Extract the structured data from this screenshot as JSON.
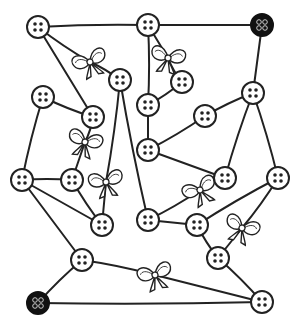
{
  "puzzle": {
    "type": "button-and-bow string network",
    "colors": {
      "line": "#222222",
      "button_fill": "#ffffff",
      "special_button_fill": "#111111"
    },
    "buttons": [
      {
        "id": "b1",
        "x": 38,
        "y": 27,
        "kind": "normal"
      },
      {
        "id": "b2",
        "x": 148,
        "y": 25,
        "kind": "normal"
      },
      {
        "id": "b3",
        "x": 262,
        "y": 25,
        "kind": "special-dark"
      },
      {
        "id": "b4",
        "x": 120,
        "y": 80,
        "kind": "normal"
      },
      {
        "id": "b5",
        "x": 182,
        "y": 82,
        "kind": "normal"
      },
      {
        "id": "b6",
        "x": 148,
        "y": 105,
        "kind": "normal"
      },
      {
        "id": "b7",
        "x": 205,
        "y": 116,
        "kind": "normal"
      },
      {
        "id": "b8",
        "x": 253,
        "y": 93,
        "kind": "normal"
      },
      {
        "id": "b9",
        "x": 43,
        "y": 97,
        "kind": "normal"
      },
      {
        "id": "b10",
        "x": 93,
        "y": 117,
        "kind": "normal"
      },
      {
        "id": "b11",
        "x": 148,
        "y": 150,
        "kind": "normal"
      },
      {
        "id": "b12",
        "x": 22,
        "y": 180,
        "kind": "normal"
      },
      {
        "id": "b13",
        "x": 72,
        "y": 180,
        "kind": "normal"
      },
      {
        "id": "b14",
        "x": 225,
        "y": 178,
        "kind": "normal"
      },
      {
        "id": "b15",
        "x": 278,
        "y": 178,
        "kind": "normal"
      },
      {
        "id": "b16",
        "x": 102,
        "y": 225,
        "kind": "normal"
      },
      {
        "id": "b17",
        "x": 148,
        "y": 220,
        "kind": "normal"
      },
      {
        "id": "b18",
        "x": 197,
        "y": 225,
        "kind": "normal"
      },
      {
        "id": "b19",
        "x": 218,
        "y": 258,
        "kind": "normal"
      },
      {
        "id": "b20",
        "x": 82,
        "y": 260,
        "kind": "normal"
      },
      {
        "id": "b21",
        "x": 38,
        "y": 303,
        "kind": "special-dark"
      },
      {
        "id": "b22",
        "x": 262,
        "y": 302,
        "kind": "normal"
      }
    ],
    "bows": [
      {
        "id": "w1",
        "x": 90,
        "y": 62
      },
      {
        "id": "w2",
        "x": 168,
        "y": 58
      },
      {
        "id": "w3",
        "x": 85,
        "y": 142
      },
      {
        "id": "w4",
        "x": 106,
        "y": 182
      },
      {
        "id": "w5",
        "x": 200,
        "y": 190
      },
      {
        "id": "w6",
        "x": 242,
        "y": 228
      },
      {
        "id": "w7",
        "x": 155,
        "y": 275
      }
    ],
    "strings": [
      [
        "b1",
        "b2"
      ],
      [
        "b2",
        "b3"
      ],
      [
        "b1",
        "w1"
      ],
      [
        "w1",
        "b4"
      ],
      [
        "b1",
        "b10"
      ],
      [
        "b9",
        "b10"
      ],
      [
        "b10",
        "w3"
      ],
      [
        "w3",
        "b13"
      ],
      [
        "b9",
        "b12"
      ],
      [
        "b12",
        "b13"
      ],
      [
        "b12",
        "b16"
      ],
      [
        "b13",
        "b16"
      ],
      [
        "b4",
        "w4"
      ],
      [
        "w4",
        "b16"
      ],
      [
        "b4",
        "b17"
      ],
      [
        "b2",
        "b6"
      ],
      [
        "b2",
        "w2"
      ],
      [
        "w2",
        "b5"
      ],
      [
        "b5",
        "b6"
      ],
      [
        "b6",
        "b11"
      ],
      [
        "b11",
        "b7"
      ],
      [
        "b7",
        "b8"
      ],
      [
        "b3",
        "b8"
      ],
      [
        "b8",
        "b14"
      ],
      [
        "b8",
        "b15"
      ],
      [
        "b11",
        "b14"
      ],
      [
        "b17",
        "w5"
      ],
      [
        "w5",
        "b14"
      ],
      [
        "b17",
        "b18"
      ],
      [
        "b15",
        "b18"
      ],
      [
        "b15",
        "w6"
      ],
      [
        "w6",
        "b19"
      ],
      [
        "b18",
        "b19"
      ],
      [
        "b19",
        "b22"
      ],
      [
        "b12",
        "b20"
      ],
      [
        "b20",
        "b21"
      ],
      [
        "b20",
        "w7"
      ],
      [
        "w7",
        "b22"
      ],
      [
        "b21",
        "b22"
      ]
    ]
  }
}
